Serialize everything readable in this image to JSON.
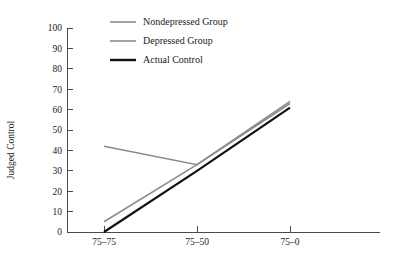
{
  "chart_data": {
    "type": "line",
    "title": "",
    "subtitle": "",
    "xlabel": "",
    "ylabel": "Judged Control",
    "categories": [
      "75–75",
      "75–50",
      "75–0"
    ],
    "x": [
      0,
      1,
      2
    ],
    "xlim": [
      -0.45,
      2.75
    ],
    "ylim": [
      0,
      100
    ],
    "ytick_labels": [
      "0",
      "10",
      "20",
      "30",
      "40",
      "50",
      "60",
      "70",
      "80",
      "90",
      "100"
    ],
    "ytick_values": [
      0,
      10,
      20,
      30,
      40,
      50,
      60,
      70,
      80,
      90,
      100
    ],
    "grid": false,
    "legend_position": "top-center",
    "series": [
      {
        "name": "Nondepressed Group",
        "values": [
          42,
          33,
          63
        ],
        "color": "#8c8c8c",
        "width": 1.6
      },
      {
        "name": "Depressed Group",
        "values": [
          5,
          33,
          64
        ],
        "color": "#8c8c8c",
        "width": 1.6
      },
      {
        "name": "Actual Control",
        "values": [
          0,
          30,
          61
        ],
        "color": "#111111",
        "width": 2.2
      }
    ]
  },
  "axes": {
    "y_title": "Judged Control",
    "x_ticks": [
      "75–75",
      "75–50",
      "75–0"
    ],
    "y_ticks": [
      "100",
      "90",
      "80",
      "70",
      "60",
      "50",
      "40",
      "30",
      "20",
      "10",
      "0"
    ]
  },
  "legend": {
    "entries": [
      {
        "label": "Nondepressed Group",
        "color": "#8c8c8c",
        "width": 1.6
      },
      {
        "label": "Depressed Group",
        "color": "#8c8c8c",
        "width": 1.6
      },
      {
        "label": "Actual Control",
        "color": "#111111",
        "width": 2.4
      }
    ]
  },
  "colors": {
    "background": "#ffffff",
    "axis": "#4a4a4a",
    "gray_series": "#8c8c8c",
    "black_series": "#111111",
    "text": "#1a1a1a"
  }
}
